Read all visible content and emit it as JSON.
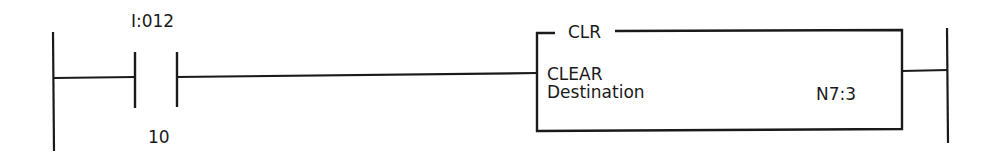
{
  "diagram": {
    "type": "ladder-logic-rung",
    "colors": {
      "line": "#1a1a1a",
      "background": "#ffffff"
    },
    "contact": {
      "kind": "examine-if-closed",
      "address": "I:012",
      "bit": "10"
    },
    "instruction": {
      "mnemonic": "CLR",
      "name": "CLEAR",
      "parameter_label": "Destination",
      "parameter_value": "N7:3"
    }
  }
}
